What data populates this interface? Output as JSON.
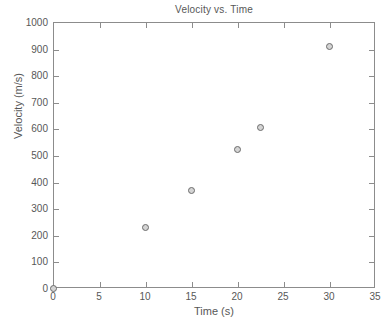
{
  "chart_data": {
    "type": "scatter",
    "title": "Velocity vs. Time",
    "xlabel": "Time (s)",
    "ylabel": "Velocity (m/s)",
    "xlim": [
      0,
      35
    ],
    "ylim": [
      0,
      1000
    ],
    "xticks": [
      0,
      5,
      10,
      15,
      20,
      25,
      30,
      35
    ],
    "yticks": [
      0,
      100,
      200,
      300,
      400,
      500,
      600,
      700,
      800,
      900,
      1000
    ],
    "xtick_labels": [
      "0",
      "5",
      "10",
      "15",
      "20",
      "25",
      "30",
      "35"
    ],
    "ytick_labels": [
      "0",
      "100",
      "200",
      "300",
      "400",
      "500",
      "600",
      "700",
      "800",
      "900",
      "1000"
    ],
    "grid": false,
    "legend": null,
    "series": [
      {
        "name": "Velocity",
        "marker": "open-circle",
        "marker_edge_color": "#6b6b6b",
        "marker_face_color": "#d4d4d4",
        "x": [
          0,
          10,
          15,
          20,
          22.5,
          30
        ],
        "y": [
          0,
          228,
          367,
          520,
          605,
          908
        ],
        "points": [
          {
            "x": 0,
            "y": 0
          },
          {
            "x": 10,
            "y": 228
          },
          {
            "x": 15,
            "y": 367
          },
          {
            "x": 20,
            "y": 520
          },
          {
            "x": 22.5,
            "y": 605
          },
          {
            "x": 30,
            "y": 908
          }
        ]
      }
    ],
    "axis_color": "#8c8c8c",
    "text_color": "#575757",
    "background_color": "#ffffff"
  }
}
